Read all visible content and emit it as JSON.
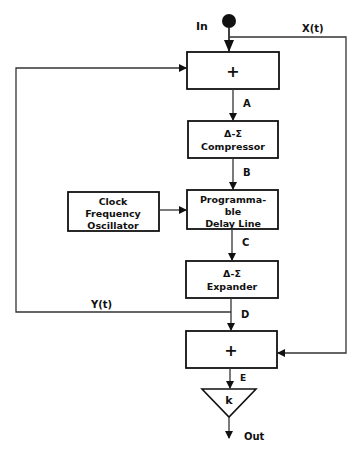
{
  "diagram": {
    "input_label": "In",
    "output_label": "Out",
    "feedforward_label": "X(t)",
    "feedback_label": "Y(t)",
    "nodes": {
      "sum1": {
        "symbol": "+"
      },
      "compressor": {
        "line1": "Δ-Σ",
        "line2": "Compressor"
      },
      "delay": {
        "line1": "Programma-",
        "line2": "ble",
        "line3": "Delay Line"
      },
      "clock": {
        "line1": "Clock",
        "line2": "Frequency",
        "line3": "Oscillator"
      },
      "expander": {
        "line1": "Δ-Σ",
        "line2": "Expander"
      },
      "sum2": {
        "symbol": "+"
      },
      "gain": {
        "symbol": "k"
      }
    },
    "signals": {
      "a": "A",
      "b": "B",
      "c": "C",
      "d": "D",
      "e": "E"
    }
  }
}
